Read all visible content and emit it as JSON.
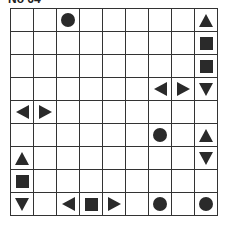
{
  "title": "No 64",
  "grid": {
    "rows": 9,
    "cols": 9,
    "pieces": [
      {
        "row": 0,
        "col": 2,
        "shape": "circle"
      },
      {
        "row": 0,
        "col": 8,
        "shape": "up"
      },
      {
        "row": 1,
        "col": 8,
        "shape": "square"
      },
      {
        "row": 2,
        "col": 8,
        "shape": "square"
      },
      {
        "row": 3,
        "col": 6,
        "shape": "left"
      },
      {
        "row": 3,
        "col": 7,
        "shape": "right"
      },
      {
        "row": 3,
        "col": 8,
        "shape": "down"
      },
      {
        "row": 4,
        "col": 0,
        "shape": "left"
      },
      {
        "row": 4,
        "col": 1,
        "shape": "right"
      },
      {
        "row": 5,
        "col": 6,
        "shape": "circle"
      },
      {
        "row": 5,
        "col": 8,
        "shape": "up"
      },
      {
        "row": 6,
        "col": 0,
        "shape": "up"
      },
      {
        "row": 6,
        "col": 8,
        "shape": "down"
      },
      {
        "row": 7,
        "col": 0,
        "shape": "square"
      },
      {
        "row": 8,
        "col": 0,
        "shape": "down"
      },
      {
        "row": 8,
        "col": 2,
        "shape": "left"
      },
      {
        "row": 8,
        "col": 3,
        "shape": "square"
      },
      {
        "row": 8,
        "col": 4,
        "shape": "right"
      },
      {
        "row": 8,
        "col": 6,
        "shape": "circle"
      },
      {
        "row": 8,
        "col": 8,
        "shape": "circle"
      }
    ]
  }
}
